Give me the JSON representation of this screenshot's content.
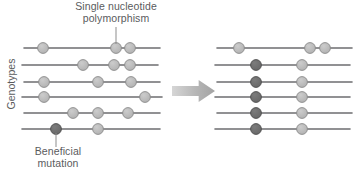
{
  "labels": {
    "snp": "Single nucleotide\npolymorphism",
    "beneficial": "Beneficial\nmutation",
    "genotypes": "Genotypes"
  },
  "colors": {
    "line": "#6d6e70",
    "snp_fill": "#b9b9b9",
    "snp_stroke": "#8a8a8a",
    "mutation_fill": "#6f6f6f",
    "mutation_stroke": "#4d4d4d",
    "arrow": "#b4b4b4",
    "text": "#5a5b5d"
  },
  "chart_data": {
    "type": "diagram",
    "panels": [
      {
        "name": "before",
        "x_range": [
          22,
          162
        ],
        "rows": [
          {
            "y": 48,
            "x1": 24,
            "x2": 160,
            "markers": [
              {
                "x": 43,
                "kind": "snp"
              },
              {
                "x": 116,
                "kind": "snp"
              },
              {
                "x": 130,
                "kind": "snp"
              }
            ]
          },
          {
            "y": 65,
            "x1": 22,
            "x2": 158,
            "markers": [
              {
                "x": 83,
                "kind": "snp"
              },
              {
                "x": 114,
                "kind": "snp"
              },
              {
                "x": 130,
                "kind": "snp"
              }
            ]
          },
          {
            "y": 82,
            "x1": 24,
            "x2": 160,
            "markers": [
              {
                "x": 44,
                "kind": "snp"
              },
              {
                "x": 98,
                "kind": "snp"
              },
              {
                "x": 131,
                "kind": "snp"
              }
            ]
          },
          {
            "y": 97,
            "x1": 22,
            "x2": 162,
            "markers": [
              {
                "x": 44,
                "kind": "snp"
              },
              {
                "x": 145,
                "kind": "snp"
              }
            ]
          },
          {
            "y": 113,
            "x1": 24,
            "x2": 160,
            "markers": [
              {
                "x": 73,
                "kind": "snp"
              },
              {
                "x": 98,
                "kind": "snp"
              },
              {
                "x": 128,
                "kind": "snp"
              }
            ]
          },
          {
            "y": 129,
            "x1": 22,
            "x2": 160,
            "markers": [
              {
                "x": 56,
                "kind": "mutation"
              },
              {
                "x": 98,
                "kind": "snp"
              }
            ]
          }
        ]
      },
      {
        "name": "after",
        "x_range": [
          215,
          352
        ],
        "rows": [
          {
            "y": 48,
            "x1": 217,
            "x2": 352,
            "markers": [
              {
                "x": 239,
                "kind": "snp"
              },
              {
                "x": 310,
                "kind": "snp"
              },
              {
                "x": 325,
                "kind": "snp"
              }
            ]
          },
          {
            "y": 65,
            "x1": 215,
            "x2": 350,
            "markers": [
              {
                "x": 256,
                "kind": "mutation"
              },
              {
                "x": 302,
                "kind": "snp"
              }
            ]
          },
          {
            "y": 82,
            "x1": 217,
            "x2": 352,
            "markers": [
              {
                "x": 256,
                "kind": "mutation"
              },
              {
                "x": 302,
                "kind": "snp"
              }
            ]
          },
          {
            "y": 97,
            "x1": 215,
            "x2": 350,
            "markers": [
              {
                "x": 256,
                "kind": "mutation"
              },
              {
                "x": 302,
                "kind": "snp"
              }
            ]
          },
          {
            "y": 113,
            "x1": 217,
            "x2": 352,
            "markers": [
              {
                "x": 256,
                "kind": "mutation"
              },
              {
                "x": 302,
                "kind": "snp"
              }
            ]
          },
          {
            "y": 129,
            "x1": 215,
            "x2": 350,
            "markers": [
              {
                "x": 256,
                "kind": "mutation"
              },
              {
                "x": 302,
                "kind": "snp"
              }
            ]
          }
        ]
      }
    ],
    "leaders": [
      {
        "name": "snp-leader",
        "x1": 116,
        "y1": 44,
        "x2": 116,
        "y2": 27
      },
      {
        "name": "beneficial-leader",
        "x1": 56,
        "y1": 133,
        "x2": 56,
        "y2": 147
      }
    ],
    "arrow": {
      "x": 172,
      "y": 91,
      "width": 43,
      "height": 22
    }
  }
}
